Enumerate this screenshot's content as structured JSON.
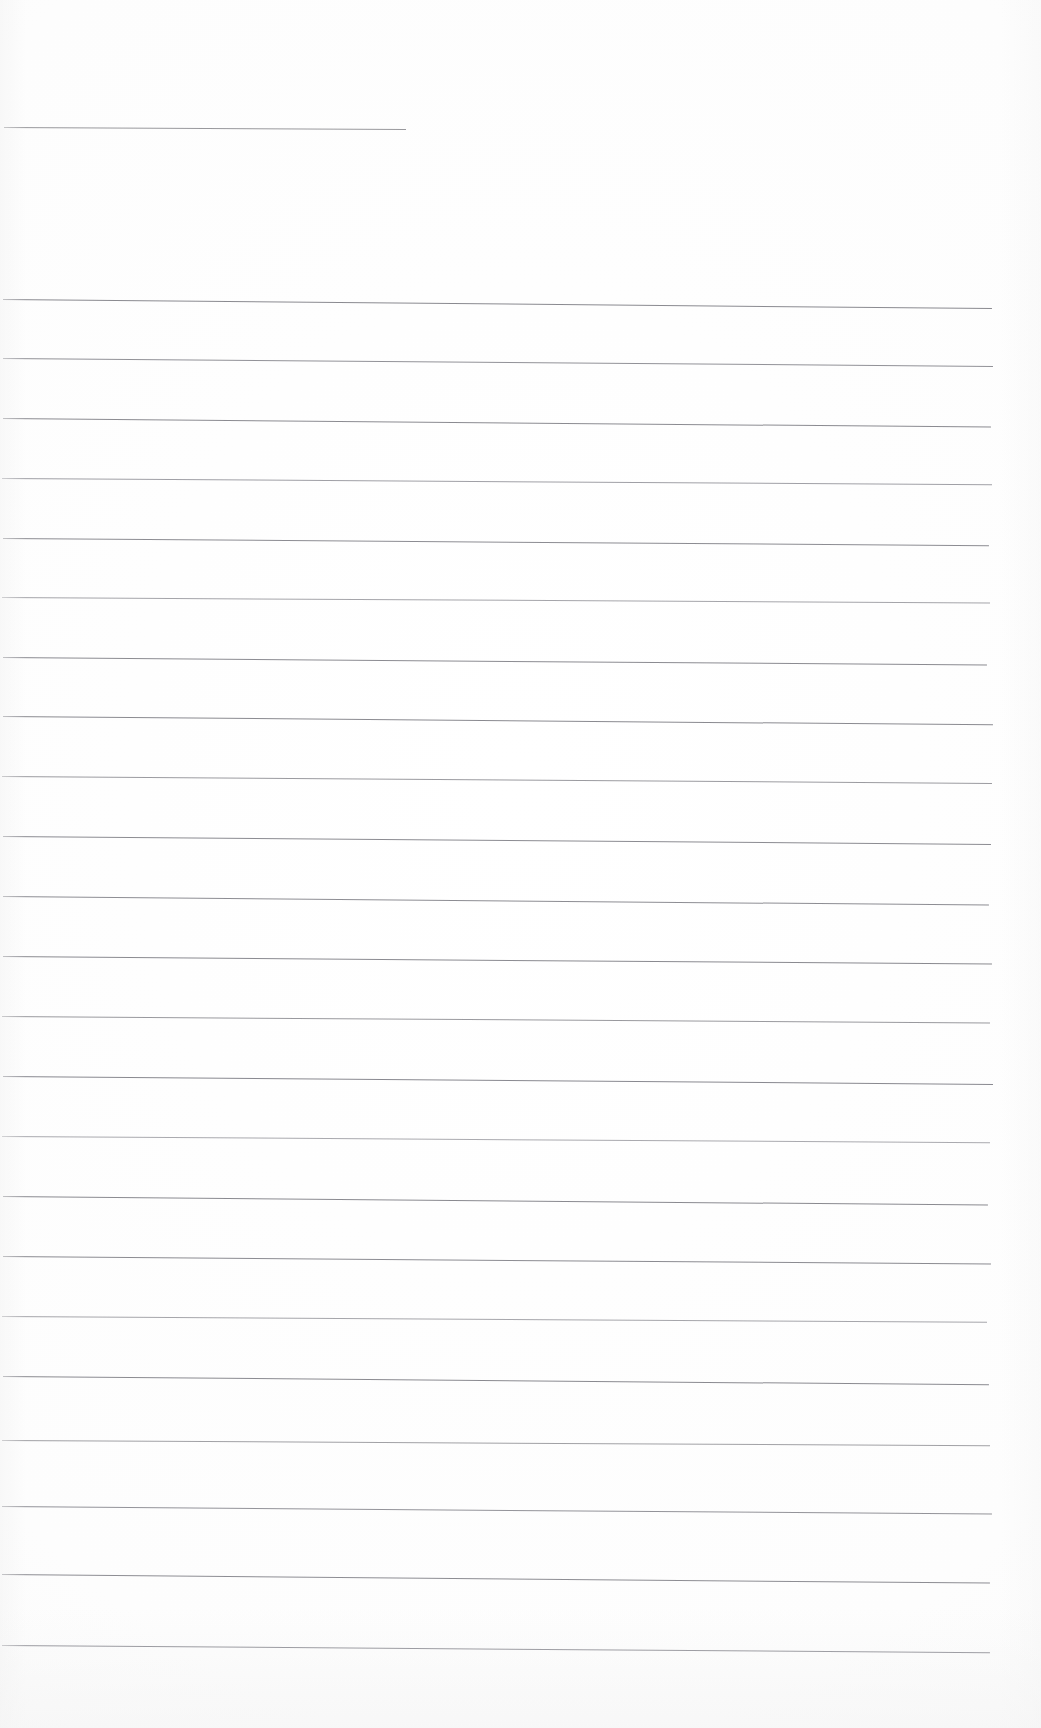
{
  "document": {
    "kind": "scanned-blank-ruled-page",
    "page_label": "",
    "background_color": "#fdfdfd",
    "page_width": 1041,
    "page_height": 1728,
    "rule_color": "#8a8a8e",
    "rule_color_faint": "#a8a8ad",
    "rule_thickness_px": 1,
    "content_text": "",
    "visible_text": ""
  },
  "rules": [
    {
      "id": "rule-1",
      "top": 127,
      "left": 4,
      "width": 402,
      "skew_deg": 0.3,
      "color": "#87878c",
      "opacity": 0.85
    },
    {
      "id": "rule-2",
      "top": 299,
      "left": 3,
      "width": 989,
      "skew_deg": 0.52,
      "color": "#84848a",
      "opacity": 0.95
    },
    {
      "id": "rule-3",
      "top": 358,
      "left": 3,
      "width": 990,
      "skew_deg": 0.46,
      "color": "#88888e",
      "opacity": 0.92
    },
    {
      "id": "rule-4",
      "top": 418,
      "left": 3,
      "width": 988,
      "skew_deg": 0.5,
      "color": "#85858b",
      "opacity": 0.95
    },
    {
      "id": "rule-5",
      "top": 478,
      "left": 2,
      "width": 990,
      "skew_deg": 0.36,
      "color": "#93939a",
      "opacity": 0.88
    },
    {
      "id": "rule-6",
      "top": 538,
      "left": 3,
      "width": 986,
      "skew_deg": 0.42,
      "color": "#86868c",
      "opacity": 0.95
    },
    {
      "id": "rule-7",
      "top": 597,
      "left": 2,
      "width": 988,
      "skew_deg": 0.32,
      "color": "#96969c",
      "opacity": 0.86
    },
    {
      "id": "rule-8",
      "top": 657,
      "left": 3,
      "width": 984,
      "skew_deg": 0.44,
      "color": "#85858b",
      "opacity": 0.95
    },
    {
      "id": "rule-9",
      "top": 716,
      "left": 3,
      "width": 990,
      "skew_deg": 0.48,
      "color": "#84848a",
      "opacity": 0.95
    },
    {
      "id": "rule-10",
      "top": 776,
      "left": 2,
      "width": 990,
      "skew_deg": 0.4,
      "color": "#909096",
      "opacity": 0.9
    },
    {
      "id": "rule-11",
      "top": 836,
      "left": 3,
      "width": 988,
      "skew_deg": 0.46,
      "color": "#85858b",
      "opacity": 0.95
    },
    {
      "id": "rule-12",
      "top": 896,
      "left": 3,
      "width": 986,
      "skew_deg": 0.5,
      "color": "#86868c",
      "opacity": 0.94
    },
    {
      "id": "rule-13",
      "top": 956,
      "left": 3,
      "width": 989,
      "skew_deg": 0.44,
      "color": "#84848a",
      "opacity": 0.95
    },
    {
      "id": "rule-14",
      "top": 1016,
      "left": 2,
      "width": 988,
      "skew_deg": 0.38,
      "color": "#8e8e94",
      "opacity": 0.9
    },
    {
      "id": "rule-15",
      "top": 1076,
      "left": 3,
      "width": 990,
      "skew_deg": 0.46,
      "color": "#83838a",
      "opacity": 0.96
    },
    {
      "id": "rule-16",
      "top": 1136,
      "left": 2,
      "width": 988,
      "skew_deg": 0.36,
      "color": "#9a9aa0",
      "opacity": 0.84
    },
    {
      "id": "rule-17",
      "top": 1196,
      "left": 3,
      "width": 985,
      "skew_deg": 0.5,
      "color": "#84848a",
      "opacity": 0.95
    },
    {
      "id": "rule-18",
      "top": 1256,
      "left": 3,
      "width": 988,
      "skew_deg": 0.44,
      "color": "#85858b",
      "opacity": 0.95
    },
    {
      "id": "rule-19",
      "top": 1316,
      "left": 2,
      "width": 985,
      "skew_deg": 0.34,
      "color": "#97979d",
      "opacity": 0.86
    },
    {
      "id": "rule-20",
      "top": 1376,
      "left": 3,
      "width": 986,
      "skew_deg": 0.48,
      "color": "#84848a",
      "opacity": 0.95
    },
    {
      "id": "rule-21",
      "top": 1440,
      "left": 2,
      "width": 988,
      "skew_deg": 0.3,
      "color": "#949499",
      "opacity": 0.88
    },
    {
      "id": "rule-22",
      "top": 1506,
      "left": 2,
      "width": 990,
      "skew_deg": 0.44,
      "color": "#8a8a90",
      "opacity": 0.92
    },
    {
      "id": "rule-23",
      "top": 1574,
      "left": 2,
      "width": 988,
      "skew_deg": 0.5,
      "color": "#86868c",
      "opacity": 0.94
    },
    {
      "id": "rule-24",
      "top": 1645,
      "left": 2,
      "width": 988,
      "skew_deg": 0.42,
      "color": "#83838a",
      "opacity": 0.95
    }
  ]
}
